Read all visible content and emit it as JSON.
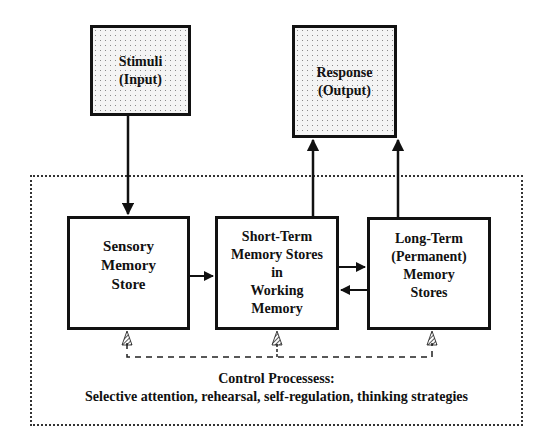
{
  "diagram": {
    "type": "flowchart",
    "nodes": [
      {
        "id": "stimuli",
        "label": "Stimuli\n(Input)"
      },
      {
        "id": "response",
        "label": "Response\n(Output)"
      },
      {
        "id": "sensory",
        "label": "Sensory\nMemory\nStore"
      },
      {
        "id": "short_term",
        "label": "Short-Term\nMemory Stores\nin\nWorking\nMemory"
      },
      {
        "id": "long_term",
        "label": "Long-Term\n(Permanent)\nMemory\nStores"
      }
    ],
    "edges": [
      {
        "from": "stimuli",
        "to": "sensory"
      },
      {
        "from": "sensory",
        "to": "short_term"
      },
      {
        "from": "short_term",
        "to": "long_term"
      },
      {
        "from": "long_term",
        "to": "short_term"
      },
      {
        "from": "short_term",
        "to": "response"
      },
      {
        "from": "long_term",
        "to": "response"
      },
      {
        "from": "control_processes",
        "to": "sensory",
        "style": "dashed"
      },
      {
        "from": "control_processes",
        "to": "short_term",
        "style": "dashed"
      },
      {
        "from": "control_processes",
        "to": "long_term",
        "style": "dashed"
      }
    ],
    "control": {
      "title": "Control Processess:",
      "subtitle": "Selective attention, rehearsal, self-regulation, thinking strategies"
    }
  }
}
